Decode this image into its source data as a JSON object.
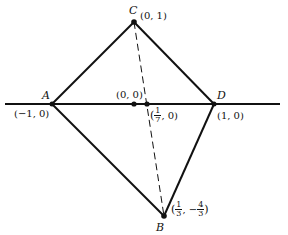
{
  "diagram": {
    "type": "geometry",
    "baseline": {
      "x1": 5,
      "y1": 104,
      "x2": 280,
      "y2": 104
    },
    "points": {
      "A": {
        "label": "A",
        "coord_text": "(−1, 0)",
        "px": [
          52,
          104
        ]
      },
      "C": {
        "label": "C",
        "coord_text": "(0, 1)",
        "px": [
          134,
          22
        ]
      },
      "D": {
        "label": "D",
        "coord_text": "(1, 0)",
        "px": [
          214,
          104
        ]
      },
      "B": {
        "label": "B",
        "coord_text_prefix": "(",
        "frac1_num": "1",
        "frac1_den": "3",
        "sep": ", −",
        "frac2_num": "4",
        "frac2_den": "3",
        "coord_text_suffix": ")",
        "px": [
          164,
          216
        ]
      },
      "O": {
        "coord_text": "(0, 0)",
        "px": [
          134,
          104
        ]
      },
      "P": {
        "coord_text_prefix": "(",
        "frac_num": "1",
        "frac_den": "7",
        "coord_text_suffix": ", 0)",
        "px": [
          147,
          104
        ]
      }
    },
    "solid_edges": [
      [
        "A",
        "C"
      ],
      [
        "C",
        "D"
      ],
      [
        "A",
        "B"
      ],
      [
        "D",
        "B"
      ]
    ],
    "dashed_edges": [
      [
        "C",
        "B"
      ]
    ],
    "stroke_color": "#111111"
  }
}
